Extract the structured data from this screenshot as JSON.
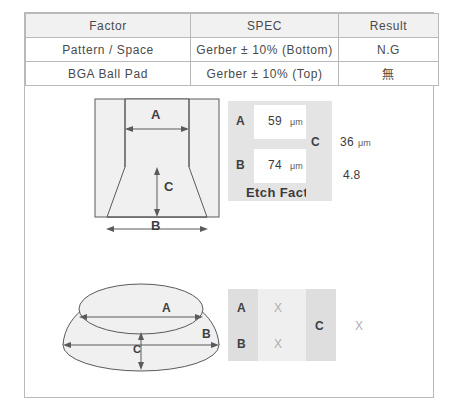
{
  "table": {
    "headers": [
      "Factor",
      "SPEC",
      "Result"
    ],
    "rows": [
      {
        "factor": "Pattern / Space",
        "spec": "Gerber ± 10% (Bottom)",
        "result": "N.G"
      },
      {
        "factor": "BGA Ball Pad",
        "spec": "Gerber ± 10% (Top)",
        "result": "無"
      }
    ]
  },
  "etch_section": {
    "diagram": {
      "label_a": "A",
      "label_b": "B",
      "label_c": "C"
    },
    "measurements": [
      {
        "label": "A",
        "value": "59",
        "unit": "μm"
      },
      {
        "label": "B",
        "value": "74",
        "unit": "μm"
      },
      {
        "label": "C",
        "value": "36",
        "unit": "μm"
      }
    ],
    "etch_factor_label": "Etch Factor",
    "etch_factor_value": "4.8"
  },
  "bga_section": {
    "diagram": {
      "label_a": "A",
      "label_b": "B",
      "label_c": "C"
    },
    "measurements": [
      {
        "label": "A",
        "value": "X"
      },
      {
        "label": "B",
        "value": "X"
      },
      {
        "label": "C",
        "value": "X"
      }
    ]
  },
  "colors": {
    "border": "#b9b9b9",
    "header_fill": "#f1f1f1",
    "panel_gray": "#e4e4e4",
    "panel_gray_light": "#efefef",
    "panel_gray_dark": "#dedede",
    "diagram_fill": "#f0f0f0",
    "diagram_stroke": "#5a5a5a",
    "text": "#3f3f3f",
    "muted_text": "#b0b0b0"
  }
}
